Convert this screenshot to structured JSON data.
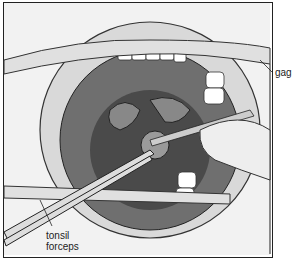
{
  "figure": {
    "labels": {
      "gag": "gag",
      "forceps_line1": "tonsil",
      "forceps_line2": "forceps"
    }
  }
}
